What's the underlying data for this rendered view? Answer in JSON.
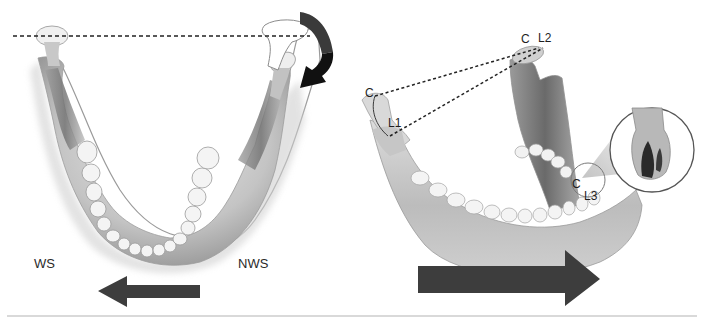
{
  "figure": {
    "left_panel": {
      "labels": {
        "working_side": "WS",
        "non_working_side": "NWS"
      },
      "arrow_direction": "left",
      "rotation_arrow": "clockwise-curved"
    },
    "right_panel": {
      "labels": {
        "condyle_left": "C",
        "l1": "L1",
        "condyle_top": "C",
        "l2": "L2",
        "condyle_inset": "C",
        "l3": "L3"
      },
      "arrow_direction": "right",
      "inset": "tooth-cross-section"
    },
    "colors": {
      "arrow": "#3d3d3d",
      "rotation_arrow_dark": "#111111",
      "rotation_arrow_mid": "#3a3a3a",
      "bone_light": "#e6e6e6",
      "bone_mid": "#b8b8b8",
      "bone_dark": "#7a7a7a",
      "divider": "#d9d9d9"
    }
  }
}
